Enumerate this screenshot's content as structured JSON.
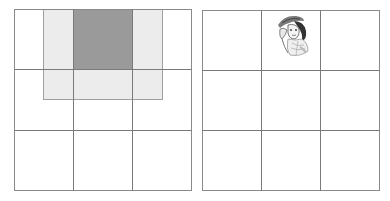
{
  "figure": {
    "left_panel": {
      "description": "3x3 grid with a 2x1.5-cell light gray window centered over the top-middle cell, which is filled dark gray",
      "grid": {
        "rows": 3,
        "cols": 3
      },
      "highlight_cell": {
        "row": 0,
        "col": 1
      },
      "colors": {
        "grid_line": "#7a7a7a",
        "light_window": "#ececec",
        "dark_cell": "#9a9a9a"
      }
    },
    "right_panel": {
      "description": "3x3 grid with a small sketched portrait in the top-middle cell",
      "grid": {
        "rows": 3,
        "cols": 3
      },
      "image_cell": {
        "row": 0,
        "col": 1
      },
      "image_icon": "portrait-sketch-icon",
      "colors": {
        "grid_line": "#7a7a7a"
      }
    }
  }
}
